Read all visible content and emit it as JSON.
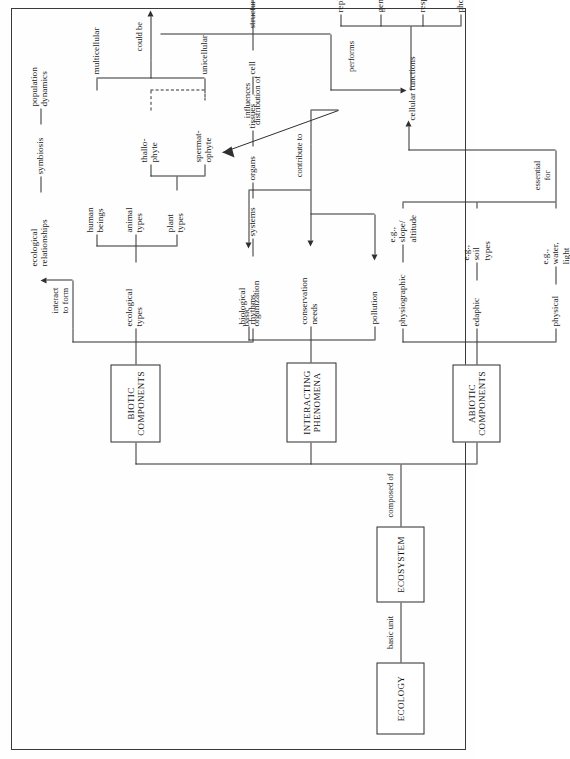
{
  "diagram": {
    "title": "ECOLOGY",
    "orientation": "rotated-90-ccw",
    "boxes": {
      "ecology": "ECOLOGY",
      "ecosystem": "ECOSYSTEM",
      "interacting_phenomena": "INTERACTING\nPHENOMENA",
      "abiotic_components": "ABIOTIC\nCOMPONENTS",
      "biotic_components": "BIOTIC\nCOMPONENTS"
    },
    "link_labels": {
      "basic_unit": "basic unit",
      "composed_of": "composed of",
      "interact_to_form": "interact\nto form",
      "could_be": "could be",
      "performs": "performs",
      "essential_for": "essential\nfor",
      "contribute_to": "contribute to",
      "influences_distribution_of": "influences\ndistribution of"
    },
    "abiotic": {
      "branches": [
        {
          "name": "physical",
          "example": "e.g.,\nwater,\nlight"
        },
        {
          "name": "edaphic",
          "example": "e.g.,\nsoil\ntypes"
        },
        {
          "name": "physiographic",
          "example": "e.g.,\nslope/\naltitude"
        }
      ]
    },
    "interacting": {
      "branches": [
        "pollution",
        "conservation\nneeds",
        "biological\nrhythms"
      ]
    },
    "biotic": {
      "basic_organization": {
        "label": "basic\norganization",
        "chain": [
          "systems",
          "organs",
          "tissues",
          "cell"
        ]
      },
      "cell": {
        "structure_label": "structure",
        "arrangement_label": "arrangement",
        "parts": [
          "membranes",
          "organelles",
          "protoplasm"
        ],
        "functions_label": "cellular functions",
        "functions": [
          "photosynthesis",
          "respiration",
          "genetic",
          "replication"
        ]
      },
      "ecological_types": {
        "label": "ecological\ntypes",
        "groups": [
          "plant\ntypes",
          "animal\ntypes",
          "human\nbeings"
        ],
        "plant_subtypes": [
          "spermat-\nophyte",
          "thallo-\nphyte"
        ],
        "cellularity": [
          "unicellular",
          "multicellular"
        ]
      },
      "ecological_relationships": {
        "label": "ecological\nrelationships",
        "items": [
          "symbiosis",
          "population\ndynamics"
        ]
      }
    }
  }
}
